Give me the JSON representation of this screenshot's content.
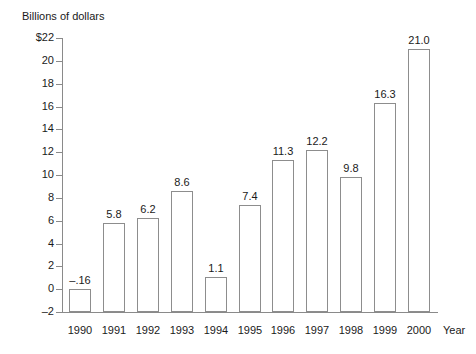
{
  "chart_data": {
    "type": "bar",
    "title": "",
    "ylabel": "Billions of dollars",
    "xlabel": "Year",
    "categories": [
      "1990",
      "1991",
      "1992",
      "1993",
      "1994",
      "1995",
      "1996",
      "1997",
      "1998",
      "1999",
      "2000"
    ],
    "values": [
      -0.16,
      5.8,
      6.2,
      8.6,
      1.1,
      7.4,
      11.3,
      12.2,
      9.8,
      16.3,
      21.0
    ],
    "value_labels": [
      "–.16",
      "5.8",
      "6.2",
      "8.6",
      "1.1",
      "7.4",
      "11.3",
      "12.2",
      "9.8",
      "16.3",
      "21.0"
    ],
    "ylim": [
      -2,
      22
    ],
    "ytick_values": [
      22,
      20,
      18,
      16,
      14,
      12,
      10,
      8,
      6,
      4,
      2,
      0,
      -2
    ],
    "ytick_labels": [
      "$22",
      "20",
      "18",
      "16",
      "14",
      "12",
      "10",
      "8",
      "6",
      "4",
      "2",
      "0",
      "–2"
    ],
    "grid": false,
    "legend": false,
    "bar_style": "outlined-unfilled",
    "colors": {
      "bar_outline": "#8d8d8d",
      "bar_fill": "#ffffff",
      "axis": "#8a8a8a",
      "text": "#1a1a1a",
      "background": "#ffffff"
    }
  }
}
